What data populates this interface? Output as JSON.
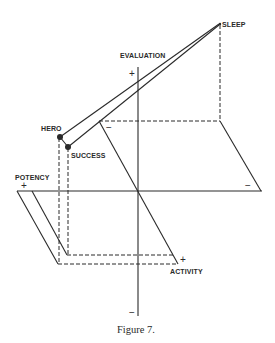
{
  "figure": {
    "caption": "Figure 7.",
    "axes": {
      "evaluation": {
        "label": "EVALUATION",
        "plus": "+",
        "minus": "−"
      },
      "potency": {
        "label": "POTENCY",
        "plus": "+",
        "minus": "−"
      },
      "activity": {
        "label": "ACTIVITY",
        "plus": "+",
        "minus": "−"
      }
    },
    "points": [
      {
        "label": "SLEEP"
      },
      {
        "label": "HERO"
      },
      {
        "label": "SUCCESS"
      }
    ],
    "colors": {
      "ink": "#2a2a2a",
      "background": "#ffffff"
    }
  }
}
